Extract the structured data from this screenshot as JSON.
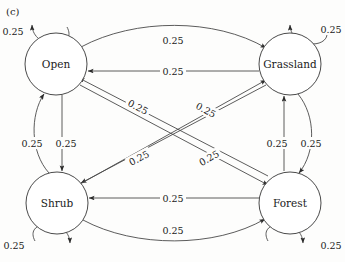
{
  "figure": {
    "panel_label": "(c)",
    "type": "state-transition-diagram"
  },
  "nodes": [
    {
      "id": "open",
      "label": "Open",
      "cx": 56,
      "cy": 64,
      "r": 31
    },
    {
      "id": "grassland",
      "label": "Grassland",
      "cx": 290,
      "cy": 64,
      "r": 31
    },
    {
      "id": "shrub",
      "label": "Shrub",
      "cx": 57,
      "cy": 203,
      "r": 31
    },
    {
      "id": "forest",
      "label": "Forest",
      "cx": 290,
      "cy": 203,
      "r": 31
    }
  ],
  "edges": [
    {
      "id": "open-open",
      "from": "Open",
      "to": "Open",
      "weight": "0.25",
      "lx": 14,
      "ly": 31
    },
    {
      "id": "grassland-grassland",
      "from": "Grassland",
      "to": "Grassland",
      "weight": "0.25",
      "lx": 331,
      "ly": 29
    },
    {
      "id": "shrub-shrub",
      "from": "Shrub",
      "to": "Shrub",
      "weight": "0.25",
      "lx": 15,
      "ly": 245
    },
    {
      "id": "forest-forest",
      "from": "Forest",
      "to": "Forest",
      "weight": "0.25",
      "lx": 331,
      "ly": 245
    },
    {
      "id": "open-grassland",
      "from": "Open",
      "to": "Grassland",
      "weight": "0.25",
      "lx": 173,
      "ly": 40
    },
    {
      "id": "grassland-open",
      "from": "Grassland",
      "to": "Open",
      "weight": "0.25",
      "lx": 173,
      "ly": 71
    },
    {
      "id": "shrub-forest",
      "from": "Shrub",
      "to": "Forest",
      "weight": "0.25",
      "lx": 173,
      "ly": 230
    },
    {
      "id": "forest-shrub",
      "from": "Forest",
      "to": "Shrub",
      "weight": "0.25",
      "lx": 173,
      "ly": 202
    },
    {
      "id": "shrub-open",
      "from": "Shrub",
      "to": "Open",
      "weight": "0.25",
      "lx": 32,
      "ly": 143
    },
    {
      "id": "open-shrub",
      "from": "Open",
      "to": "Shrub",
      "weight": "0.25",
      "lx": 66,
      "ly": 143
    },
    {
      "id": "forest-grassland",
      "from": "Forest",
      "to": "Grassland",
      "weight": "0.25",
      "lx": 277,
      "ly": 143
    },
    {
      "id": "grassland-forest",
      "from": "Grassland",
      "to": "Forest",
      "weight": "0.25",
      "lx": 311,
      "ly": 143
    },
    {
      "id": "open-forest",
      "from": "Open",
      "to": "Forest",
      "weight": "0.25",
      "lx": 206,
      "ly": 110
    },
    {
      "id": "forest-open",
      "from": "Forest",
      "to": "Open",
      "weight": "0.25",
      "lx": 138,
      "ly": 107
    },
    {
      "id": "grassland-shrub",
      "from": "Grassland",
      "to": "Shrub",
      "weight": "0.25",
      "lx": 139,
      "ly": 158
    },
    {
      "id": "shrub-grassland",
      "from": "Shrub",
      "to": "Grassland",
      "weight": "0.25",
      "lx": 209,
      "ly": 158
    }
  ],
  "style": {
    "stroke_color": "#4a4a4a",
    "text_color": "#1a1a1a",
    "node_fill": "#ffffff",
    "background": "#fdfdfc"
  }
}
